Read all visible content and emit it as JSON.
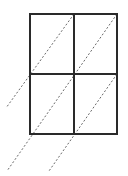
{
  "diagram": {
    "type": "grid-with-oblique-projection-lines",
    "canvas": {
      "width": 128,
      "height": 176,
      "background": "#ffffff"
    },
    "grid": {
      "rows": 2,
      "cols": 2,
      "x0": 30,
      "y0": 14,
      "x1": 117,
      "y1": 134,
      "midX": 74,
      "midY": 74,
      "stroke": "#2a2a2a",
      "stroke_width": 2
    },
    "dashed_lines": [
      {
        "id": "diag-1",
        "x1": 74,
        "y1": 14,
        "x2": 6,
        "y2": 108
      },
      {
        "id": "diag-2",
        "x1": 117,
        "y1": 14,
        "x2": 7,
        "y2": 171
      },
      {
        "id": "diag-3",
        "x1": 117,
        "y1": 74,
        "x2": 49,
        "y2": 171
      }
    ],
    "dash_style": {
      "stroke": "#6a6a6a",
      "stroke_width": 1,
      "dasharray": "2,2"
    }
  }
}
